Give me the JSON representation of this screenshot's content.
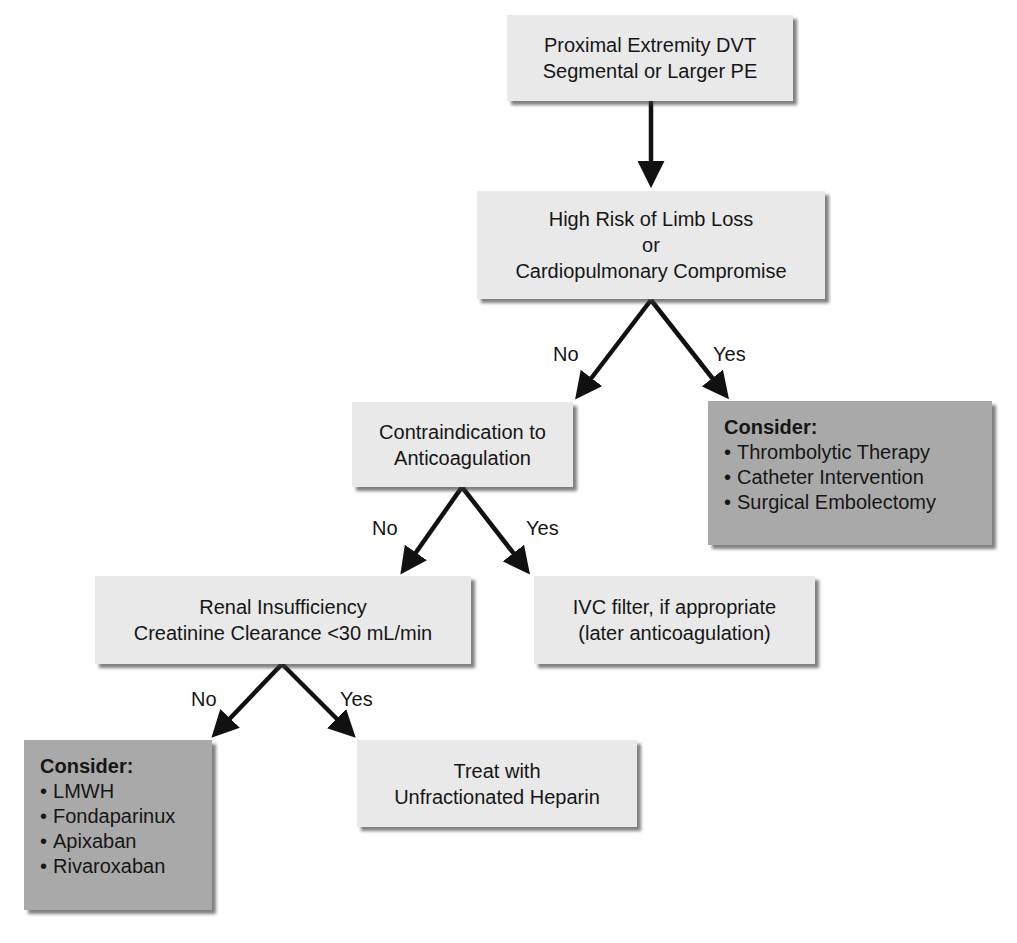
{
  "nodes": {
    "start": {
      "lines": [
        "Proximal Extremity DVT",
        "Segmental or Larger PE"
      ]
    },
    "high_risk": {
      "lines": [
        "High Risk of Limb Loss",
        "or",
        "Cardiopulmonary Compromise"
      ]
    },
    "contraindication": {
      "lines": [
        "Contraindication to",
        "Anticoagulation"
      ]
    },
    "consider_invasive": {
      "heading": "Consider:",
      "items": [
        "Thrombolytic Therapy",
        "Catheter Intervention",
        "Surgical Embolectomy"
      ]
    },
    "renal": {
      "lines": [
        "Renal Insufficiency",
        "Creatinine Clearance <30 mL/min"
      ]
    },
    "ivc": {
      "lines": [
        "IVC filter, if appropriate",
        "(later anticoagulation)"
      ]
    },
    "consider_anticoag": {
      "heading": "Consider:",
      "items": [
        "LMWH",
        "Fondaparinux",
        "Apixaban",
        "Rivaroxaban"
      ]
    },
    "ufh": {
      "lines": [
        "Treat with",
        "Unfractionated Heparin"
      ]
    }
  },
  "edges": {
    "high_risk_no": "No",
    "high_risk_yes": "Yes",
    "contra_no": "No",
    "contra_yes": "Yes",
    "renal_no": "No",
    "renal_yes": "Yes"
  },
  "colors": {
    "light_box": "#e9e9e9",
    "dark_box": "#a9a9a9",
    "arrow": "#111111",
    "text": "#161616"
  }
}
